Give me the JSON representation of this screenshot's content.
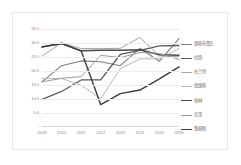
{
  "chart_data": {
    "type": "line",
    "title": "",
    "xlabel": "",
    "ylabel": "",
    "categories": [
      "2009",
      "2010",
      "2011",
      "2012",
      "2013",
      "2014",
      "2015",
      "2016"
    ],
    "ylim": [
      0,
      35
    ],
    "yticks": [
      "35.0",
      "30.0",
      "25.0",
      "20.0",
      "15.0",
      "10.0",
      "5.0",
      "-"
    ],
    "grid": true,
    "legend_position": "right",
    "series": [
      {
        "name": "维斯布鲁克",
        "color": "#7d7d7d",
        "width": 1.1,
        "values": [
          16.1,
          21.9,
          23.6,
          23.3,
          21.9,
          28.1,
          23.5,
          31.6
        ]
      },
      {
        "name": "哈登",
        "color": "#5a5a5a",
        "width": 1.3,
        "values": [
          9.9,
          12.7,
          16.8,
          16.8,
          25.9,
          27.4,
          29.0,
          29.1
        ]
      },
      {
        "name": "杜兰特",
        "color": "#a5a5a5",
        "width": 1.0,
        "values": [
          25.3,
          30.1,
          28.0,
          28.0,
          28.1,
          32.0,
          25.4,
          25.1
        ]
      },
      {
        "name": "德维斯",
        "color": "#b8b8b8",
        "width": 1.0,
        "values": [
          17.3,
          17.3,
          14.9,
          10.1,
          20.8,
          24.3,
          24.4,
          28.0
        ]
      },
      {
        "name": "格林",
        "color": "#4a4a4a",
        "width": 1.5,
        "values": [
          28.6,
          29.8,
          27.2,
          27.4,
          27.4,
          27.6,
          25.8,
          25.6
        ]
      },
      {
        "name": "库里",
        "color": "#9a9a9a",
        "width": 1.0,
        "values": [
          16.1,
          17.4,
          18.0,
          25.6,
          24.8,
          26.6,
          26.3,
          24.1
        ]
      },
      {
        "name": "詹姆斯",
        "color": "#3c3c3c",
        "width": 1.4,
        "values": [
          28.6,
          29.8,
          27.2,
          8.0,
          11.9,
          13.2,
          17.2,
          21.5
        ]
      }
    ]
  }
}
